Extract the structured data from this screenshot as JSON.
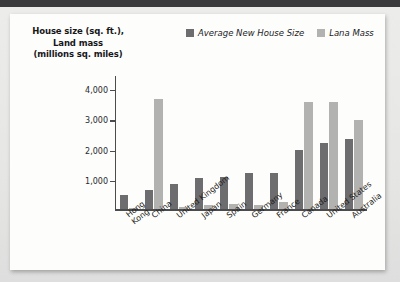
{
  "chart_data": {
    "type": "bar",
    "title": "",
    "ylabel": "House size (sq. ft.), Land mass (millions sq. miles)",
    "xlabel": "",
    "ylim": [
      0,
      4400
    ],
    "yticks": [
      "1,000",
      "2,000",
      "3,000",
      "4,000"
    ],
    "ytick_values": [
      1000,
      2000,
      3000,
      4000
    ],
    "grid": false,
    "legend_position": "top-right",
    "categories": [
      "Hong\nKong",
      "China",
      "United Kingdom",
      "Japan",
      "Spain",
      "Germany",
      "France",
      "Canada",
      "United States",
      "Australia"
    ],
    "series": [
      {
        "name": "Average New House Size",
        "color": "#6d6d6f",
        "values": [
          480,
          650,
          830,
          1030,
          1060,
          1190,
          1220,
          1980,
          2200,
          2320
        ]
      },
      {
        "name": "Lana Mass",
        "color": "#b2b2b1",
        "values": [
          10,
          3650,
          90,
          140,
          190,
          135,
          250,
          3550,
          3550,
          2950
        ]
      }
    ]
  },
  "axis_title": {
    "line1": "House size (sq. ft.),",
    "line2": "Land mass",
    "line3": "(millions sq. miles)"
  },
  "legend": {
    "items": [
      {
        "label": "Average New House Size",
        "color": "#6d6d6f"
      },
      {
        "label": "Lana Mass",
        "color": "#b2b2b1"
      }
    ]
  }
}
